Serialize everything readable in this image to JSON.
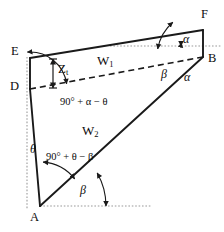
{
  "figure": {
    "type": "geometry-diagram",
    "background_color": "#ffffff",
    "line_color": "#1a1a1a",
    "guide_color": "#9a9a9a"
  },
  "vertices": [
    {
      "id": "A",
      "label": "A",
      "x": 40,
      "y": 206
    },
    {
      "id": "D",
      "label": "D",
      "x": 30,
      "y": 89
    },
    {
      "id": "E",
      "label": "E",
      "x": 30,
      "y": 58
    },
    {
      "id": "F",
      "label": "F",
      "x": 203,
      "y": 30
    },
    {
      "id": "B",
      "label": "B",
      "x": 203,
      "y": 57
    }
  ],
  "vertex_labels": [
    {
      "name": "vertex-label-F",
      "text": "F",
      "x": 201,
      "y": 8
    },
    {
      "name": "vertex-label-E",
      "text": "E",
      "x": 11,
      "y": 45
    },
    {
      "name": "vertex-label-B",
      "text": "B",
      "x": 208,
      "y": 52
    },
    {
      "name": "vertex-label-D",
      "text": "D",
      "x": 10,
      "y": 80
    },
    {
      "name": "vertex-label-A",
      "text": "A",
      "x": 30,
      "y": 211
    }
  ],
  "segment_labels": [
    {
      "name": "segment-label-w1",
      "base": "W",
      "sub": "1",
      "x": 97,
      "y": 54
    },
    {
      "name": "segment-label-w2",
      "base": "W",
      "sub": "2",
      "x": 82,
      "y": 124
    },
    {
      "name": "segment-label-zt",
      "base": "Z",
      "sub": "t",
      "x": 58,
      "y": 62
    }
  ],
  "angle_labels": [
    {
      "name": "angle-label-alpha-top",
      "text": "α",
      "x": 183,
      "y": 33
    },
    {
      "name": "angle-label-beta-b",
      "text": "β",
      "x": 161,
      "y": 68
    },
    {
      "name": "angle-label-alpha-b",
      "text": "α",
      "x": 184,
      "y": 71
    },
    {
      "name": "angle-label-theta-left",
      "text": "θ",
      "x": 30,
      "y": 143
    },
    {
      "name": "angle-label-beta-a",
      "text": "β",
      "x": 80,
      "y": 184
    }
  ],
  "angle_expressions": [
    {
      "name": "angle-expression-d",
      "text": "90° + α − θ",
      "x": 60,
      "y": 97
    },
    {
      "name": "angle-expression-a",
      "text": "90° + θ − β",
      "x": 46,
      "y": 152
    }
  ],
  "solid_edges": [
    {
      "name": "edge-E-F",
      "from": "E",
      "to": "F"
    },
    {
      "name": "edge-F-B",
      "from": "F",
      "to": "B"
    },
    {
      "name": "edge-B-A",
      "from": "B",
      "to": "A"
    },
    {
      "name": "edge-A-D",
      "from": "A",
      "to": "D"
    },
    {
      "name": "edge-D-E",
      "from": "D",
      "to": "E"
    }
  ],
  "dashed_edges": [
    {
      "name": "edge-D-B-dashed",
      "from": "D",
      "to": "B"
    }
  ],
  "guides": [
    {
      "name": "guide-horizontal-top",
      "x1": 110,
      "y1": 46,
      "x2": 222,
      "y2": 46
    },
    {
      "name": "guide-horizontal-bottom",
      "x1": 40,
      "y1": 206,
      "x2": 152,
      "y2": 206
    },
    {
      "name": "guide-vertical-left",
      "x1": 27,
      "y1": 57,
      "x2": 27,
      "y2": 209
    }
  ],
  "dimension_arrows": [
    {
      "name": "dimension-arrow-zt",
      "x": 53,
      "y1": 59,
      "y2": 88
    }
  ],
  "angle_arcs": [
    {
      "name": "arc-alpha-top",
      "cx": 203,
      "cy": 46,
      "r": 22,
      "a0": 180,
      "a1": 189
    },
    {
      "name": "arc-beta-b",
      "cx": 203,
      "cy": 57,
      "r": 46,
      "a0": 190,
      "a1": 229
    },
    {
      "name": "arc-d-angle",
      "cx": 30,
      "cy": 89,
      "r": 37,
      "a0": 352,
      "a1": 266
    },
    {
      "name": "arc-a-angle",
      "cx": 40,
      "cy": 206,
      "r": 44,
      "a0": 274,
      "a1": 322
    },
    {
      "name": "arc-beta-a",
      "cx": 40,
      "cy": 206,
      "r": 66,
      "a0": 330,
      "a1": 360
    }
  ]
}
